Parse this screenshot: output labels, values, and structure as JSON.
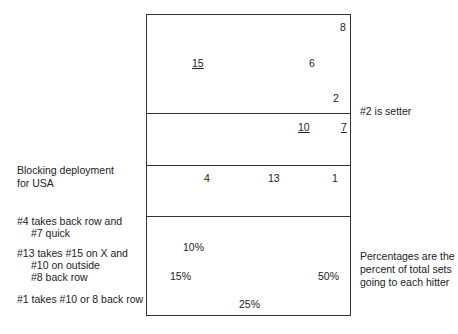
{
  "court": {
    "players_top": [
      {
        "label": "8",
        "x": 340,
        "y": 21,
        "underline": false
      },
      {
        "label": "15",
        "x": 192,
        "y": 57,
        "underline": true
      },
      {
        "label": "6",
        "x": 309,
        "y": 57,
        "underline": false
      },
      {
        "label": "2",
        "x": 333,
        "y": 92,
        "underline": false
      },
      {
        "label": "10",
        "x": 298,
        "y": 121,
        "underline": true
      },
      {
        "label": "7",
        "x": 341,
        "y": 121,
        "underline": true
      }
    ],
    "blockers": [
      {
        "label": "4",
        "x": 204,
        "y": 172
      },
      {
        "label": "13",
        "x": 268,
        "y": 172
      },
      {
        "label": "1",
        "x": 332,
        "y": 172
      }
    ],
    "percentages": [
      {
        "label": "10%",
        "x": 183,
        "y": 241
      },
      {
        "label": "15%",
        "x": 170,
        "y": 270
      },
      {
        "label": "50%",
        "x": 318,
        "y": 270
      },
      {
        "label": "25%",
        "x": 239,
        "y": 298
      }
    ]
  },
  "notes": {
    "setter": "#2 is setter",
    "blocking_title_1": "Blocking deployment",
    "blocking_title_2": "for USA",
    "rule1_a": "#4 takes back row and",
    "rule1_b": "#7 quick",
    "rule2_a": "#13 takes #15 on X and",
    "rule2_b": "#10 on outside",
    "rule2_c": "#8 back row",
    "rule3": "#1 takes #10 or 8 back row",
    "pct_1": "Percentages are the",
    "pct_2": "percent of total sets",
    "pct_3": "going to each hitter"
  }
}
